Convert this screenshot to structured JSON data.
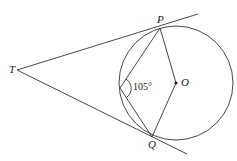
{
  "diagram": {
    "type": "geometry",
    "points": {
      "T": {
        "label": "T",
        "x": 17,
        "y": 70
      },
      "P": {
        "label": "P",
        "x": 160,
        "y": 28
      },
      "Q": {
        "label": "Q",
        "x": 152,
        "y": 137
      },
      "O": {
        "label": "O",
        "x": 176,
        "y": 83
      },
      "R": {
        "label": "",
        "x": 120,
        "y": 88
      }
    },
    "circle": {
      "cx": 176,
      "cy": 83,
      "r": 57
    },
    "angle_label": "105°",
    "stroke_color": "#333333"
  }
}
